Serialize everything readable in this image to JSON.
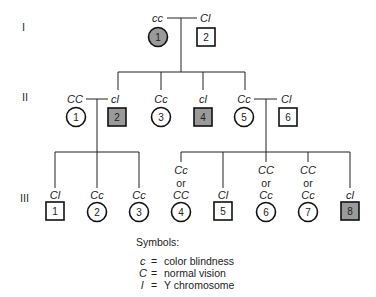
{
  "generations": [
    {
      "label": "I"
    },
    {
      "label": "II"
    },
    {
      "label": "III"
    }
  ],
  "colors": {
    "affected_fill": "#9a9a9a",
    "unaffected_fill": "#ffffff",
    "stroke": "#111111"
  },
  "gen1": [
    {
      "id": "1",
      "sex": "female",
      "affected": true,
      "genotype": "cc"
    },
    {
      "id": "2",
      "sex": "male",
      "affected": false,
      "genotype": "Cɫ"
    }
  ],
  "gen2": [
    {
      "id": "1",
      "sex": "female",
      "affected": false,
      "genotype": "CC"
    },
    {
      "id": "2",
      "sex": "male",
      "affected": true,
      "genotype": "cɫ"
    },
    {
      "id": "3",
      "sex": "female",
      "affected": false,
      "genotype": "Cc"
    },
    {
      "id": "4",
      "sex": "male",
      "affected": true,
      "genotype": "cɫ"
    },
    {
      "id": "5",
      "sex": "female",
      "affected": false,
      "genotype": "Cc"
    },
    {
      "id": "6",
      "sex": "male",
      "affected": false,
      "genotype": "Cɫ"
    }
  ],
  "gen3": [
    {
      "id": "1",
      "sex": "male",
      "affected": false,
      "genotype": "Cɫ"
    },
    {
      "id": "2",
      "sex": "female",
      "affected": false,
      "genotype": "Cc"
    },
    {
      "id": "3",
      "sex": "female",
      "affected": false,
      "genotype": "Cc"
    },
    {
      "id": "4",
      "sex": "female",
      "affected": false,
      "genotype_top": "Cc",
      "genotype_or": "or",
      "genotype": "CC"
    },
    {
      "id": "5",
      "sex": "male",
      "affected": false,
      "genotype": "Cɫ"
    },
    {
      "id": "6",
      "sex": "female",
      "affected": false,
      "genotype_top": "CC",
      "genotype_or": "or",
      "genotype": "Cc"
    },
    {
      "id": "7",
      "sex": "female",
      "affected": false,
      "genotype_top": "CC",
      "genotype_or": "or",
      "genotype": "Cc"
    },
    {
      "id": "8",
      "sex": "male",
      "affected": true,
      "genotype": "cɫ"
    }
  ],
  "legend": {
    "title": "Symbols:",
    "items": [
      {
        "symbol": "c",
        "eq": "=",
        "meaning": "color blindness"
      },
      {
        "symbol": "C",
        "eq": "=",
        "meaning": "normal vision"
      },
      {
        "symbol": "ɫ",
        "eq": "=",
        "meaning": "Y chromosome"
      }
    ]
  }
}
